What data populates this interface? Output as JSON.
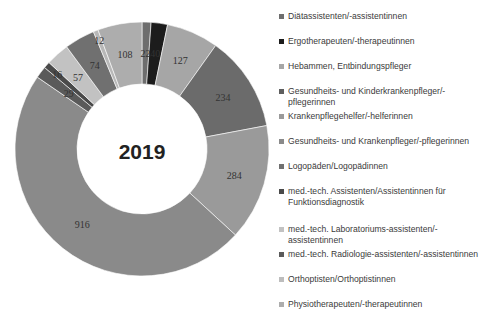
{
  "chart_data": {
    "type": "pie",
    "subtype": "donut",
    "title": "2019",
    "categories": [
      "Diätassistenten/-assistentinnen",
      "Ergotherapeuten/-therapeutinnen",
      "Hebammen, Entbindungspfleger",
      "Gesundheits- und Kinderkrankenpfleger/-pflegerinnen",
      "Krankenpflegehelfer/-helferinnen",
      "Gesundheits-  und  Krankenpfleger/-pflegerinnen",
      "Logopäden/Logopädinnen",
      "med.-tech. Assistenten/Assistentinnen für Funktionsdiagnostik",
      "med.-tech. Laboratoriums-assistenten/-assistentinnen",
      "med.-tech. Radiologie-assistenten/-assistentinnen",
      "Orthoptisten/Orthoptistinnen",
      "Physiotherapeuten/-therapeutinnen"
    ],
    "values": [
      22,
      40,
      127,
      234,
      284,
      916,
      29,
      16,
      57,
      74,
      12,
      108
    ],
    "colors": [
      "#6e6e6e",
      "#1c1c1c",
      "#a6a6a6",
      "#6b6b6b",
      "#9a9a9a",
      "#8a8a8a",
      "#5a5a5a",
      "#4a4a4a",
      "#c2c2c2",
      "#707070",
      "#b8b8b8",
      "#adadad"
    ],
    "label_colors": [
      "#333333",
      "#ffffff",
      "#333333",
      "#333333",
      "#333333",
      "#333333",
      "#333333",
      "#333333",
      "#333333",
      "#333333",
      "#333333",
      "#333333"
    ],
    "legend_position": "right",
    "start_angle_deg": 0,
    "direction": "clockwise"
  },
  "legend": {
    "items": [
      {
        "label": "Diätassistenten/-assistentinnen",
        "color": "#6e6e6e"
      },
      {
        "label": "Ergotherapeuten/-therapeutinnen",
        "color": "#1c1c1c"
      },
      {
        "label": "Hebammen, Entbindungspfleger",
        "color": "#a6a6a6"
      },
      {
        "label": "Gesundheits- und Kinderkrankenpfleger/-pflegerinnen",
        "color": "#5e5e5e"
      },
      {
        "label": "Krankenpflegehelfer/-helferinnen",
        "color": "#9a9a9a"
      },
      {
        "label": "Gesundheits-  und  Krankenpfleger/-pflegerinnen",
        "color": "#8a8a8a"
      },
      {
        "label": "Logopäden/Logopädinnen",
        "color": "#707070"
      },
      {
        "label": "med.-tech. Assistenten/Assistentinnen für Funktionsdiagnostik",
        "color": "#4a4a4a"
      },
      {
        "label": "med.-tech. Laboratoriums-assistenten/-assistentinnen",
        "color": "#c2c2c2"
      },
      {
        "label": "med.-tech. Radiologie-assistenten/-assistentinnen",
        "color": "#5a5a5a"
      },
      {
        "label": "Orthoptisten/Orthoptistinnen",
        "color": "#bdbdbd"
      },
      {
        "label": "Physiotherapeuten/-therapeutinnen",
        "color": "#adadad"
      }
    ]
  }
}
